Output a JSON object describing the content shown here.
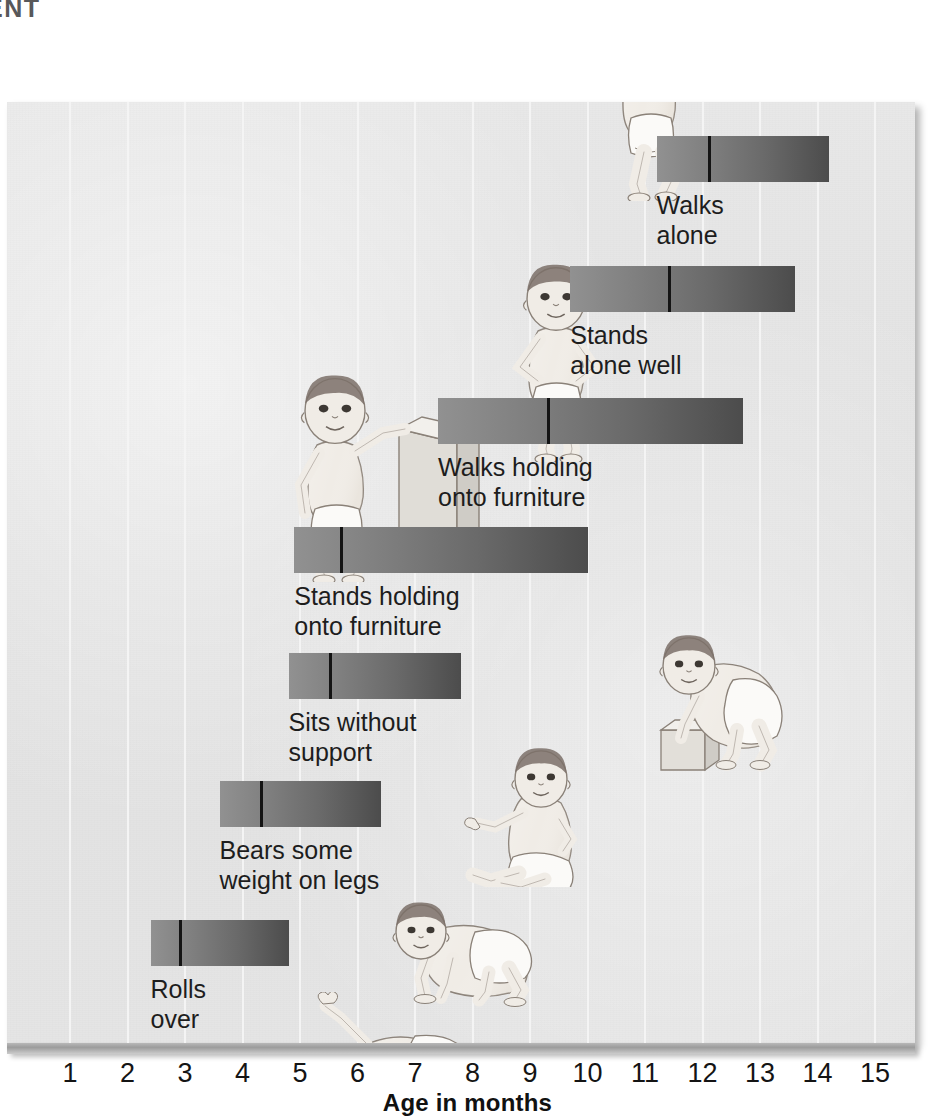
{
  "page_heading": "ENT",
  "axis": {
    "title": "Age in months",
    "tick_labels": [
      "1",
      "2",
      "3",
      "4",
      "5",
      "6",
      "7",
      "8",
      "9",
      "10",
      "11",
      "12",
      "13",
      "14",
      "15"
    ],
    "unit": "months"
  },
  "colors": {
    "panel_background": "#e4e4e4",
    "gridline": "#f4f4f4",
    "bar_start": "#919191",
    "bar_end": "#4c4c4c",
    "median_line": "#141414",
    "text": "#1d1d1d",
    "heading": "#58585a"
  },
  "chart_data": {
    "type": "bar",
    "title": "",
    "subtitle": "",
    "xlabel": "Age in months",
    "ylabel": "",
    "xlim": [
      0,
      15.6
    ],
    "grid": true,
    "legend": "none",
    "orientation": "horizontal",
    "note": "Horizontal range bars showing the age span over which each motor milestone is achieved; the vertical black line marks the median age.",
    "categories": [
      "Walks alone",
      "Stands alone well",
      "Walks holding onto furniture",
      "Stands holding onto furniture",
      "Sits without support",
      "Bears some weight on legs",
      "Rolls over"
    ],
    "bars": [
      {
        "label": "Walks alone",
        "label_text": "Walks\nalone",
        "start": 11.2,
        "median": 12.1,
        "end": 14.2
      },
      {
        "label": "Stands alone well",
        "label_text": "Stands\nalone well",
        "start": 9.7,
        "median": 11.4,
        "end": 13.6
      },
      {
        "label": "Walks holding onto furniture",
        "label_text": "Walks holding\nonto furniture",
        "start": 7.4,
        "median": 9.3,
        "end": 12.7
      },
      {
        "label": "Stands holding onto furniture",
        "label_text": "Stands holding\nonto furniture",
        "start": 4.9,
        "median": 5.7,
        "end": 10.0
      },
      {
        "label": "Sits without support",
        "label_text": "Sits without\nsupport",
        "start": 4.8,
        "median": 5.5,
        "end": 7.8
      },
      {
        "label": "Bears some weight on legs",
        "label_text": "Bears some\nweight on legs",
        "start": 3.6,
        "median": 4.3,
        "end": 6.4
      },
      {
        "label": "Rolls over",
        "label_text": "Rolls\nover",
        "start": 2.4,
        "median": 2.9,
        "end": 4.8
      }
    ]
  },
  "figures": [
    {
      "name": "infant-walking-alone",
      "caption_for": "Walks alone"
    },
    {
      "name": "infant-standing-alone",
      "caption_for": "Stands alone well"
    },
    {
      "name": "infant-standing-holding-box",
      "caption_for": "Walks holding onto furniture"
    },
    {
      "name": "infant-pulling-up-on-block",
      "caption_for": "Stands holding onto furniture"
    },
    {
      "name": "infant-sitting",
      "caption_for": "Sits without support"
    },
    {
      "name": "infant-crawling",
      "caption_for": "Bears some weight on legs"
    },
    {
      "name": "infant-rolling-over",
      "caption_for": "Rolls over"
    }
  ]
}
